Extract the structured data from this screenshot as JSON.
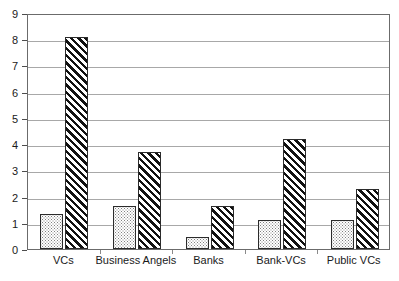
{
  "chart_data": {
    "type": "bar",
    "title": "",
    "subtitle": "",
    "xlabel": "",
    "ylabel": "",
    "categories": [
      "VCs",
      "Business Angels",
      "Banks",
      "Bank-VCs",
      "Public VCs"
    ],
    "series": [
      {
        "name": "Series 1",
        "pattern": "dotted",
        "values": [
          1.35,
          1.65,
          0.45,
          1.1,
          1.1
        ]
      },
      {
        "name": "Series 2",
        "pattern": "diagonal-hatch",
        "values": [
          8.1,
          3.7,
          1.65,
          4.2,
          2.3
        ]
      }
    ],
    "ylim": [
      0,
      9
    ],
    "y_ticks": [
      0,
      1,
      2,
      3,
      4,
      5,
      6,
      7,
      8,
      9
    ],
    "y_tick_labels": [
      "0",
      "1",
      "2",
      "3",
      "4",
      "5",
      "6",
      "7",
      "8",
      "9"
    ],
    "grid": true,
    "grid_axis": "y",
    "legend": false,
    "legend_position": "none",
    "annotations": []
  },
  "style": {
    "background": "#ffffff",
    "frame_color": "#6b6b6b",
    "gridline_color": "#a8a8a8",
    "bar_outline_color": "#2b2b2b",
    "dotted_fill_color": "#808080",
    "hatch_color": "#111111",
    "text_color": "#1a1a1a"
  }
}
